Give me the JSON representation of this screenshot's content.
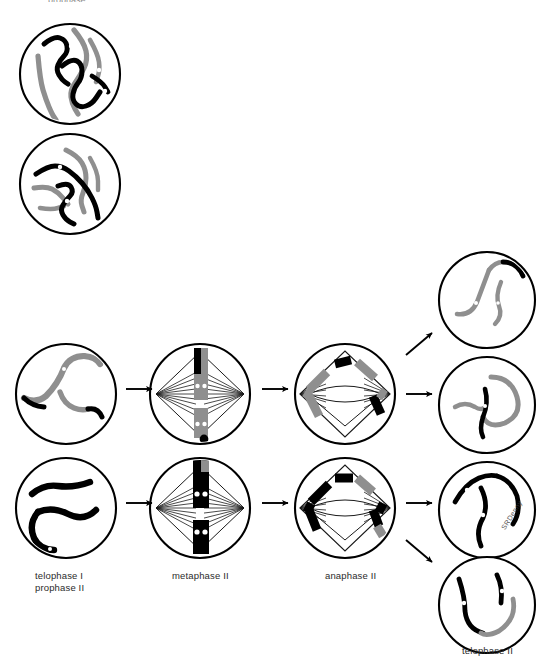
{
  "figure": {
    "topCutLabel": "prophase"
  },
  "palette": {
    "outline": "#000000",
    "maternal": "#8f8f8f",
    "paternal": "#000000",
    "centromere": "#ffffff",
    "spindle": "#1a1a1a",
    "background": "#ffffff",
    "labelText": "#2b2b2b"
  },
  "stageLabels": [
    {
      "id": "telophase-prophase",
      "text": "telophase I\nprophase II",
      "x": 35,
      "y": 573
    },
    {
      "id": "metaphase-2",
      "text": "metaphase II",
      "x": 172,
      "y": 573
    },
    {
      "id": "anaphase-2",
      "text": "anaphase II",
      "x": 325,
      "y": 573
    },
    {
      "id": "telophase-2",
      "text": "telophase II",
      "x": 462,
      "y": 647
    }
  ],
  "watermark": {
    "text": "SRDenny",
    "x": 500,
    "y": 527
  },
  "columns": [
    {
      "name": "prophase-i-overview",
      "label": "",
      "cells": [
        {
          "id": "prophase-cell-upper",
          "cx": 70,
          "cy": 74,
          "r": 50,
          "contents": "four long tangled chromosomes, two gray and two black, with white centromere dots"
        },
        {
          "id": "prophase-cell-lower",
          "cx": 70,
          "cy": 184,
          "r": 50,
          "contents": "four long tangled chromosomes, two gray and two black, with white centromere dots"
        }
      ]
    },
    {
      "name": "telophase-i-prophase-ii",
      "label": "telophase I\nprophase II",
      "cells": [
        {
          "id": "telo1-cell-upper",
          "cx": 66,
          "cy": 394,
          "r": 50,
          "contents": "gray chromosomes with black tips, decondensing"
        },
        {
          "id": "telo1-cell-lower",
          "cx": 66,
          "cy": 508,
          "r": 50,
          "contents": "thick black chromosomes, decondensing"
        }
      ]
    },
    {
      "name": "metaphase-ii",
      "label": "metaphase II",
      "cells": [
        {
          "id": "meta2-cell-upper",
          "cx": 200,
          "cy": 394,
          "r": 50,
          "contents": "two chromosomes aligned on the metaphase plate with spindle fibers from both poles"
        },
        {
          "id": "meta2-cell-lower",
          "cx": 200,
          "cy": 508,
          "r": 50,
          "contents": "two black chromosomes aligned on the metaphase plate with spindle fibers from both poles"
        }
      ]
    },
    {
      "name": "anaphase-ii",
      "label": "anaphase II",
      "cells": [
        {
          "id": "ana2-cell-upper",
          "cx": 345,
          "cy": 394,
          "r": 50,
          "contents": "sister chromatids pulled toward opposite poles"
        },
        {
          "id": "ana2-cell-lower",
          "cx": 345,
          "cy": 508,
          "r": 50,
          "contents": "sister chromatids pulled toward opposite poles"
        }
      ]
    },
    {
      "name": "telophase-ii",
      "label": "telophase II",
      "cells": [
        {
          "id": "telo2-cell-1",
          "cx": 487,
          "cy": 300,
          "r": 48,
          "contents": "gray chromosomes with one black segment"
        },
        {
          "id": "telo2-cell-2",
          "cx": 487,
          "cy": 405,
          "r": 48,
          "contents": "gray curved chromosomes with black centromere"
        },
        {
          "id": "telo2-cell-3",
          "cx": 487,
          "cy": 510,
          "r": 48,
          "contents": "black chromosomes with white centromere gaps"
        },
        {
          "id": "telo2-cell-4",
          "cx": 487,
          "cy": 605,
          "r": 48,
          "contents": "black chromosomes with a gray arc"
        }
      ]
    }
  ],
  "arrows": [
    {
      "id": "arrow-telo1-to-meta2-upper",
      "type": "right",
      "x1": 126,
      "y1": 389,
      "x2": 152,
      "y2": 389
    },
    {
      "id": "arrow-telo1-to-meta2-lower",
      "type": "right",
      "x1": 126,
      "y1": 503,
      "x2": 152,
      "y2": 503
    },
    {
      "id": "arrow-meta2-to-ana2-upper",
      "type": "right",
      "x1": 262,
      "y1": 389,
      "x2": 288,
      "y2": 389
    },
    {
      "id": "arrow-meta2-to-ana2-lower",
      "type": "right",
      "x1": 262,
      "y1": 503,
      "x2": 288,
      "y2": 503
    },
    {
      "id": "arrow-ana2-to-telo2-upper",
      "type": "diagonal-up",
      "x1": 406,
      "y1": 355,
      "x2": 432,
      "y2": 333
    },
    {
      "id": "arrow-ana2-to-telo2-mid",
      "type": "right",
      "x1": 406,
      "y1": 394,
      "x2": 432,
      "y2": 394
    },
    {
      "id": "arrow-ana2-to-telo2-lower-mid",
      "type": "right",
      "x1": 406,
      "y1": 503,
      "x2": 432,
      "y2": 503
    },
    {
      "id": "arrow-ana2-to-telo2-lower",
      "type": "diagonal-down",
      "x1": 406,
      "y1": 540,
      "x2": 432,
      "y2": 562
    }
  ]
}
